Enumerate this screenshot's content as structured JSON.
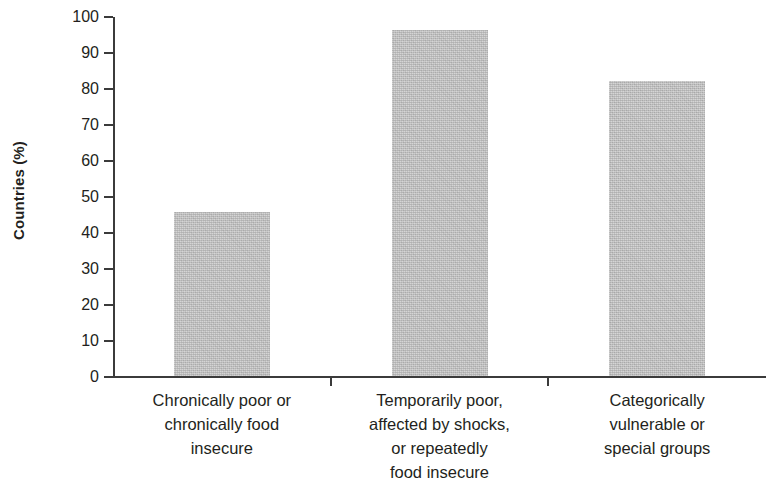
{
  "chart_data": {
    "type": "bar",
    "title": "",
    "xlabel": "",
    "ylabel": "Countries (%)",
    "ylim": [
      0,
      100
    ],
    "ytick_labels": [
      "0",
      "10",
      "20",
      "30",
      "40",
      "50",
      "60",
      "70",
      "80",
      "90",
      "100"
    ],
    "ytick_values": [
      0,
      10,
      20,
      30,
      40,
      50,
      60,
      70,
      80,
      90,
      100
    ],
    "grid": false,
    "legend": false,
    "bar_color": "#b9b9b9",
    "axis_color": "#3b3b3b",
    "text_color": "#231f20",
    "categories": [
      "Chronically poor or chronically food insecure",
      "Temporarily poor, affected by shocks, or repeatedly food insecure",
      "Categorically vulnerable or special groups"
    ],
    "category_lines": [
      [
        "Chronically poor or",
        "chronically food",
        "insecure"
      ],
      [
        "Temporarily poor,",
        "affected by shocks,",
        "or repeatedly",
        "food insecure"
      ],
      [
        "Categorically",
        "vulnerable or",
        "special groups"
      ]
    ],
    "values": [
      45.5,
      96,
      82
    ]
  }
}
